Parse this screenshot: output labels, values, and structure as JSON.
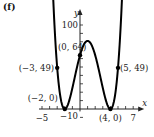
{
  "panel_label": "(f)",
  "chart_data": {
    "type": "line",
    "title": "",
    "function": "(x+2)^2 (x-4)^2",
    "xlabel": "x",
    "ylabel": "y",
    "xlim": [
      -5,
      7
    ],
    "ylim": [
      -10,
      100
    ],
    "x_ticks_step": 1,
    "y_ticks_step": 10,
    "x_tick_labels": [
      {
        "value": -5,
        "text": "−5"
      },
      {
        "value": 7,
        "text": "7"
      }
    ],
    "y_tick_labels": [
      {
        "value": 100,
        "text": "100"
      },
      {
        "value": -10,
        "text": "−10"
      }
    ],
    "grid": false,
    "points": [
      {
        "x": -3,
        "y": 49,
        "label": "(−3, 49)",
        "anchor": "left"
      },
      {
        "x": 0,
        "y": 64,
        "label": "(0, 64)",
        "anchor": "left-above"
      },
      {
        "x": 5,
        "y": 49,
        "label": "(5, 49)",
        "anchor": "right"
      },
      {
        "x": -2,
        "y": 0,
        "label": "(−2, 0)",
        "anchor": "left-above"
      },
      {
        "x": 4,
        "y": 0,
        "label": "(4, 0)",
        "anchor": "below"
      }
    ],
    "curve_x_range": [
      -3.55,
      5.55
    ]
  }
}
